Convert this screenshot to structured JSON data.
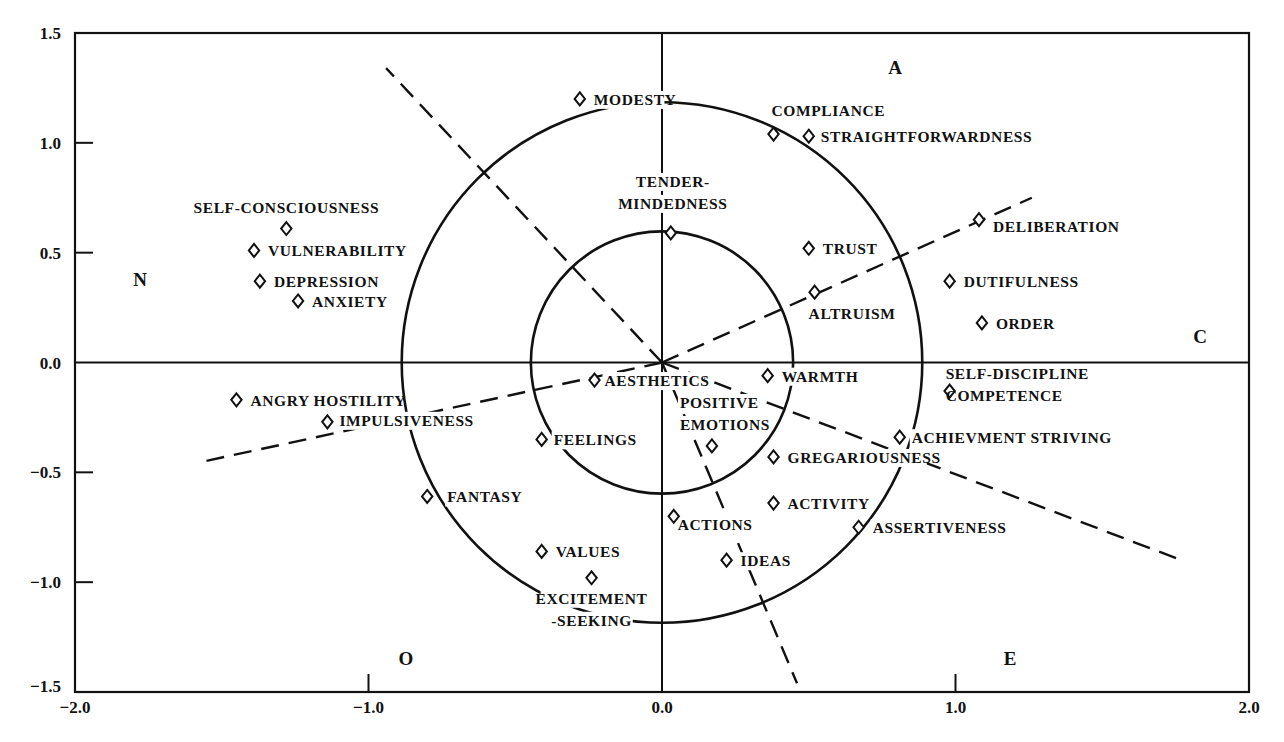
{
  "chart_data": {
    "type": "scatter",
    "title": "",
    "xlabel": "",
    "ylabel": "",
    "xlim": [
      -2.0,
      2.0
    ],
    "ylim": [
      -1.5,
      1.5
    ],
    "grid": false,
    "x_ticks": [
      {
        "value": -2.0,
        "label": "-2.0"
      },
      {
        "value": -1.0,
        "label": "-1.0"
      },
      {
        "value": 0.0,
        "label": "0.0"
      },
      {
        "value": 1.0,
        "label": "1.0"
      },
      {
        "value": 2.0,
        "label": "2.0"
      }
    ],
    "y_ticks": [
      {
        "value": 1.5,
        "label": "1.5"
      },
      {
        "value": 1.0,
        "label": "1.0"
      },
      {
        "value": 0.5,
        "label": "0.5"
      },
      {
        "value": 0.0,
        "label": "0.0"
      },
      {
        "value": -0.5,
        "label": "-0.5"
      },
      {
        "value": -1.0,
        "label": "-1.0"
      },
      {
        "value": -1.5,
        "label": "-1.5"
      }
    ],
    "factor_labels": [
      {
        "name": "A",
        "position": "top"
      },
      {
        "name": "N",
        "position": "left"
      },
      {
        "name": "C",
        "position": "right"
      },
      {
        "name": "O",
        "position": "bottom-left"
      },
      {
        "name": "E",
        "position": "bottom-right"
      }
    ],
    "reference_circles": [
      {
        "name": "inner",
        "radius": 0.44
      },
      {
        "name": "outer",
        "radius": 0.88
      }
    ],
    "factor_vectors": [
      {
        "name": "N-axis",
        "to": [
          -0.94,
          1.34
        ]
      },
      {
        "name": "C-axis",
        "to": [
          1.26,
          0.75
        ]
      },
      {
        "name": "O-axis-left",
        "to": [
          -1.56,
          -0.45
        ]
      },
      {
        "name": "E-axis",
        "to": [
          1.77,
          -0.9
        ]
      },
      {
        "name": "O-axis-down",
        "to": [
          0.46,
          -1.46
        ]
      }
    ],
    "points": [
      {
        "label": "MODESTY",
        "x": -0.28,
        "y": 1.2
      },
      {
        "label": "COMPLIANCE",
        "x": 0.38,
        "y": 1.04
      },
      {
        "label": "STRAIGHTFORWARDNESS",
        "x": 0.5,
        "y": 1.03
      },
      {
        "label": "TENDER-MINDEDNESS",
        "x": 0.03,
        "y": 0.59
      },
      {
        "label": "SELF-CONSCIOUSNESS",
        "x": -1.28,
        "y": 0.61
      },
      {
        "label": "VULNERABILITY",
        "x": -1.39,
        "y": 0.51
      },
      {
        "label": "DEPRESSION",
        "x": -1.37,
        "y": 0.37
      },
      {
        "label": "ANXIETY",
        "x": -1.24,
        "y": 0.28
      },
      {
        "label": "TRUST",
        "x": 0.5,
        "y": 0.52
      },
      {
        "label": "DELIBERATION",
        "x": 1.08,
        "y": 0.65
      },
      {
        "label": "ALTRUISM",
        "x": 0.52,
        "y": 0.32
      },
      {
        "label": "DUTIFULNESS",
        "x": 0.98,
        "y": 0.37
      },
      {
        "label": "ORDER",
        "x": 1.09,
        "y": 0.18
      },
      {
        "label": "SELF-DISCIPLINE / COMPETENCE",
        "x": 0.98,
        "y": -0.13
      },
      {
        "label": "AESTHETICS",
        "x": -0.23,
        "y": -0.08
      },
      {
        "label": "WARMTH",
        "x": 0.36,
        "y": -0.06
      },
      {
        "label": "POSITIVE EMOTIONS",
        "x": 0.17,
        "y": -0.38
      },
      {
        "label": "FEELINGS",
        "x": -0.41,
        "y": -0.35
      },
      {
        "label": "GREGARIOUSNESS",
        "x": 0.38,
        "y": -0.43
      },
      {
        "label": "ACHIEVMENT STRIVING",
        "x": 0.81,
        "y": -0.34
      },
      {
        "label": "ANGRY HOSTILITY",
        "x": -1.45,
        "y": -0.17
      },
      {
        "label": "IMPULSIVENESS",
        "x": -1.14,
        "y": -0.27
      },
      {
        "label": "FANTASY",
        "x": -0.8,
        "y": -0.61
      },
      {
        "label": "ACTIVITY",
        "x": 0.38,
        "y": -0.64
      },
      {
        "label": "ACTIONS",
        "x": 0.04,
        "y": -0.7
      },
      {
        "label": "ASSERTIVENESS",
        "x": 0.67,
        "y": -0.75
      },
      {
        "label": "VALUES",
        "x": -0.41,
        "y": -0.86
      },
      {
        "label": "IDEAS",
        "x": 0.22,
        "y": -0.9
      },
      {
        "label": "EXCITEMENT -SEEKING",
        "x": -0.24,
        "y": -0.98
      }
    ],
    "label_lines": {
      "TENDER-MINDEDNESS": [
        "TENDER-",
        "MINDEDNESS"
      ],
      "SELF-DISCIPLINE / COMPETENCE": [
        "SELF-DISCIPLINE",
        "COMPETENCE"
      ],
      "POSITIVE EMOTIONS": [
        "POSITIVE",
        "EMOTIONS"
      ],
      "EXCITEMENT -SEEKING": [
        "EXCITEMENT",
        "-SEEKING"
      ]
    }
  }
}
